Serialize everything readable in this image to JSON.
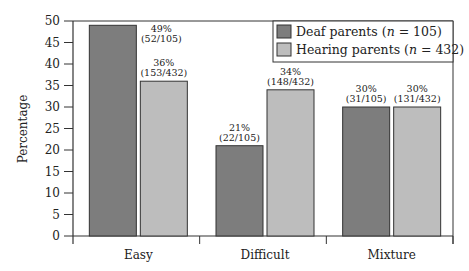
{
  "chart_data": {
    "type": "bar",
    "title": "",
    "xlabel": "",
    "ylabel": "Percentage",
    "ylim": [
      0,
      50
    ],
    "yticks": [
      0,
      5,
      10,
      15,
      20,
      25,
      30,
      35,
      40,
      45,
      50
    ],
    "grid": false,
    "legend_position": "upper right",
    "categories": [
      "Easy",
      "Difficult",
      "Mixture"
    ],
    "series": [
      {
        "name": "Deaf parents (n = 105)",
        "name_prefix": "Deaf parents (",
        "name_n": "n",
        "name_suffix": " = 105)",
        "color": "#7d7d7d",
        "values": [
          49,
          21,
          30
        ],
        "labels": [
          {
            "pct": "49%",
            "frac": "(52/105)"
          },
          {
            "pct": "21%",
            "frac": "(22/105)"
          },
          {
            "pct": "30%",
            "frac": "(31/105)"
          }
        ]
      },
      {
        "name": "Hearing parents (n = 432)",
        "name_prefix": "Hearing parents (",
        "name_n": "n",
        "name_suffix": " = 432)",
        "color": "#bdbdbd",
        "values": [
          36,
          34,
          30
        ],
        "labels": [
          {
            "pct": "36%",
            "frac": "(153/432)"
          },
          {
            "pct": "34%",
            "frac": "(148/432)"
          },
          {
            "pct": "30%",
            "frac": "(131/432)"
          }
        ]
      }
    ]
  }
}
